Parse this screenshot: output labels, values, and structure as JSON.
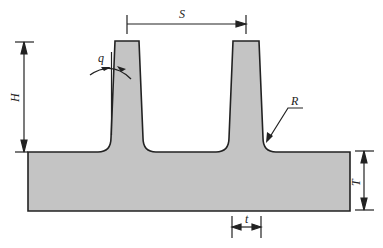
{
  "diagram": {
    "type": "fin-profile-cross-section",
    "fill_color": "#c4c4c4",
    "stroke_color": "#222222",
    "labels": {
      "S": "S",
      "H": "H",
      "q": "q",
      "R": "R",
      "T": "T",
      "t": "t"
    },
    "dimensions": [
      {
        "symbol": "S",
        "meaning": "fin pitch (spacing)"
      },
      {
        "symbol": "H",
        "meaning": "fin height"
      },
      {
        "symbol": "q",
        "meaning": "fin taper angle"
      },
      {
        "symbol": "R",
        "meaning": "root fillet radius"
      },
      {
        "symbol": "T",
        "meaning": "base thickness"
      },
      {
        "symbol": "t",
        "meaning": "fin thickness"
      }
    ]
  }
}
